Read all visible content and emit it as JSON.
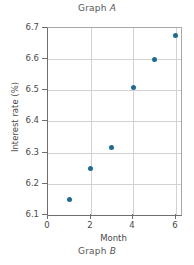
{
  "figure": {
    "title_prefix": "Graph ",
    "title_italic": "A",
    "caption_prefix": "Graph ",
    "caption_italic": "B"
  },
  "chart_data": {
    "type": "scatter",
    "title": "Graph A",
    "caption": "Graph B",
    "xlabel": "Month",
    "ylabel": "Interest rate (%)",
    "xlim": [
      0,
      6.25
    ],
    "ylim": [
      6.1,
      6.7
    ],
    "xticks": [
      0,
      2,
      4,
      6
    ],
    "xtick_labels": [
      "0",
      "2",
      "4",
      "6"
    ],
    "yticks": [
      6.1,
      6.2,
      6.3,
      6.4,
      6.5,
      6.6,
      6.7
    ],
    "ytick_labels": [
      "6.1",
      "6.2",
      "6.3",
      "6.4",
      "6.5",
      "6.6",
      "6.7"
    ],
    "grid": true,
    "grid_color": "#d2d2d2",
    "legend": null,
    "marker_color": "#1f6d8c",
    "x": [
      1,
      2,
      3,
      4,
      5,
      6
    ],
    "y": [
      6.15,
      6.25,
      6.315,
      6.51,
      6.6,
      6.675
    ],
    "points": [
      {
        "x": 1,
        "y": 6.15
      },
      {
        "x": 2,
        "y": 6.25
      },
      {
        "x": 3,
        "y": 6.315
      },
      {
        "x": 4,
        "y": 6.51
      },
      {
        "x": 5,
        "y": 6.6
      },
      {
        "x": 6,
        "y": 6.675
      }
    ]
  }
}
